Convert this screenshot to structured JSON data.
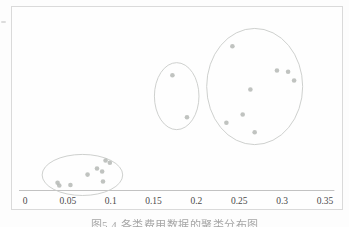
{
  "page": {
    "background": "#fdfdfd"
  },
  "figure": {
    "caption": "图5.4 各类费用数据的聚类分布图",
    "frame_color": "#dadada"
  },
  "chart_data": {
    "type": "scatter",
    "title": "",
    "xlabel": "",
    "ylabel": "",
    "x_tick_values": [
      0,
      0.05,
      0.1,
      0.15,
      0.2,
      0.25,
      0.3,
      0.35
    ],
    "x_tick_labels": [
      "0",
      "0.05",
      "0.1",
      "0.15",
      "0.2",
      "0.25",
      "0.3",
      "0.35"
    ],
    "xlim": [
      -0.007,
      0.361
    ],
    "ylim": [
      0,
      1
    ],
    "grid": false,
    "legend": "none",
    "colors": {
      "point": "#b5b8b5",
      "ellipse_stroke": "#c8cbc8",
      "axis_line": "#c2c2c2",
      "tick_label": "#4a4a4a"
    },
    "clusters": [
      {
        "name": "cluster-low-left",
        "ellipse": {
          "cx": 0.067,
          "cy": 0.084,
          "rx": 0.047,
          "ry": 0.111
        },
        "points": [
          [
            0.038,
            0.042
          ],
          [
            0.04,
            0.027
          ],
          [
            0.053,
            0.03
          ],
          [
            0.073,
            0.086
          ],
          [
            0.084,
            0.119
          ],
          [
            0.09,
            0.103
          ],
          [
            0.091,
            0.049
          ],
          [
            0.094,
            0.162
          ],
          [
            0.099,
            0.15
          ]
        ]
      },
      {
        "name": "cluster-middle",
        "ellipse": {
          "cx": 0.177,
          "cy": 0.51,
          "rx": 0.026,
          "ry": 0.181
        },
        "points": [
          [
            0.172,
            0.623
          ],
          [
            0.189,
            0.396
          ]
        ]
      },
      {
        "name": "cluster-right",
        "ellipse": {
          "cx": 0.268,
          "cy": 0.562,
          "rx": 0.056,
          "ry": 0.314
        },
        "points": [
          [
            0.242,
            0.78
          ],
          [
            0.294,
            0.649
          ],
          [
            0.307,
            0.642
          ],
          [
            0.314,
            0.595
          ],
          [
            0.263,
            0.546
          ],
          [
            0.254,
            0.411
          ],
          [
            0.235,
            0.366
          ],
          [
            0.268,
            0.315
          ]
        ]
      }
    ]
  }
}
